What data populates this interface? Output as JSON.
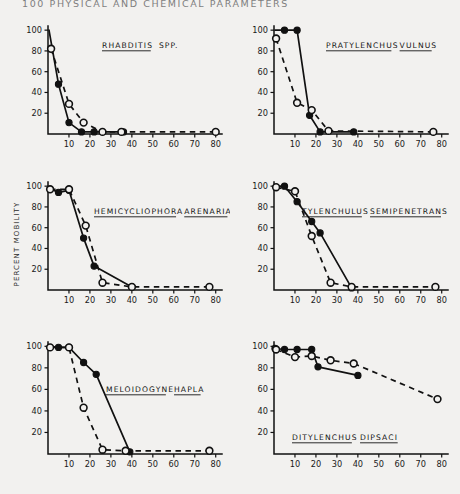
{
  "page": {
    "running_head": "100   PHYSICAL AND CHEMICAL PARAMETERS",
    "y_axis_label": "PERCENT MOBILITY",
    "ink_color": "#111111",
    "paper_color": "#f2f1ef"
  },
  "axes": {
    "y_ticks": [
      100,
      80,
      60,
      40,
      20
    ],
    "x_ticks": [
      10,
      20,
      30,
      40,
      50,
      60,
      70,
      80
    ],
    "xlim": [
      0,
      83
    ],
    "ylim": [
      0,
      104
    ]
  },
  "legend_keys": {
    "closed_circle": "solid line series (filled circles)",
    "open_circle": "dashed line series (open circles)"
  },
  "chart_data": [
    {
      "type": "line",
      "panel": 1,
      "title_words": [
        "RHABDITIS",
        "SPP."
      ],
      "title_underline": [
        true,
        false
      ],
      "xlabel": "",
      "ylabel": "PERCENT MOBILITY",
      "xlim": [
        0,
        83
      ],
      "ylim": [
        0,
        104
      ],
      "grid": false,
      "series": [
        {
          "name": "closed",
          "marker": "filled-circle",
          "line": "solid",
          "x": [
            0.5,
            5,
            10,
            16,
            22,
            36
          ],
          "y": [
            100,
            48,
            11,
            2,
            2,
            2
          ]
        },
        {
          "name": "open",
          "marker": "open-circle",
          "line": "dashed",
          "x": [
            1.5,
            10,
            17,
            26,
            35,
            80
          ],
          "y": [
            82,
            29,
            11,
            2,
            2,
            2
          ]
        }
      ]
    },
    {
      "type": "line",
      "panel": 2,
      "title_words": [
        "PRATYLENCHUS",
        "VULNUS"
      ],
      "title_underline": [
        true,
        true
      ],
      "xlabel": "",
      "ylabel": "",
      "xlim": [
        0,
        83
      ],
      "ylim": [
        0,
        104
      ],
      "grid": false,
      "series": [
        {
          "name": "closed",
          "marker": "filled-circle",
          "line": "solid",
          "x": [
            0.5,
            5,
            11,
            17,
            22,
            38
          ],
          "y": [
            100,
            100,
            100,
            18,
            2,
            2
          ]
        },
        {
          "name": "open",
          "marker": "open-circle",
          "line": "dashed",
          "x": [
            1,
            11,
            18,
            26,
            76
          ],
          "y": [
            92,
            30,
            23,
            3,
            2
          ]
        }
      ]
    },
    {
      "type": "line",
      "panel": 3,
      "title_words": [
        "HEMICYCLIOPHORA",
        "ARENARIA"
      ],
      "title_underline": [
        true,
        true
      ],
      "xlabel": "",
      "ylabel": "PERCENT MOBILITY",
      "xlim": [
        0,
        83
      ],
      "ylim": [
        0,
        104
      ],
      "grid": false,
      "series": [
        {
          "name": "closed",
          "marker": "filled-circle",
          "line": "solid",
          "x": [
            0.5,
            5,
            10,
            17,
            22,
            40
          ],
          "y": [
            98,
            94,
            96,
            50,
            23,
            3
          ]
        },
        {
          "name": "open",
          "marker": "open-circle",
          "line": "dashed",
          "x": [
            1,
            10,
            18,
            26,
            40,
            77
          ],
          "y": [
            97,
            97,
            62,
            7,
            3,
            3
          ]
        }
      ]
    },
    {
      "type": "line",
      "panel": 4,
      "title_words": [
        "TYLENCHULUS",
        "SEMIPENETRANS"
      ],
      "title_underline": [
        true,
        true
      ],
      "xlabel": "",
      "ylabel": "",
      "xlim": [
        0,
        83
      ],
      "ylim": [
        0,
        104
      ],
      "grid": false,
      "series": [
        {
          "name": "closed",
          "marker": "filled-circle",
          "line": "solid",
          "x": [
            0.5,
            5,
            11,
            18,
            22,
            37
          ],
          "y": [
            100,
            100,
            85,
            66,
            55,
            2
          ]
        },
        {
          "name": "open",
          "marker": "open-circle",
          "line": "dashed",
          "x": [
            1,
            10,
            18,
            27,
            37,
            77
          ],
          "y": [
            99,
            95,
            52,
            7,
            3,
            3
          ]
        }
      ]
    },
    {
      "type": "line",
      "panel": 5,
      "title_words": [
        "MELOIDOGYNE",
        "HAPLA"
      ],
      "title_underline": [
        true,
        true
      ],
      "xlabel": "",
      "ylabel": "",
      "xlim": [
        0,
        83
      ],
      "ylim": [
        0,
        104
      ],
      "grid": false,
      "series": [
        {
          "name": "closed",
          "marker": "filled-circle",
          "line": "solid",
          "x": [
            0.5,
            5,
            10,
            17,
            23,
            39
          ],
          "y": [
            100,
            99,
            99,
            85,
            74,
            2
          ]
        },
        {
          "name": "open",
          "marker": "open-circle",
          "line": "dashed",
          "x": [
            1,
            10,
            17,
            26,
            37,
            77
          ],
          "y": [
            99,
            99,
            43,
            4,
            3,
            3
          ]
        }
      ]
    },
    {
      "type": "line",
      "panel": 6,
      "title_words": [
        "DITYLENCHUS",
        "DIPSACI"
      ],
      "title_underline": [
        true,
        true
      ],
      "xlabel": "",
      "ylabel": "",
      "xlim": [
        0,
        83
      ],
      "ylim": [
        0,
        104
      ],
      "grid": false,
      "series": [
        {
          "name": "closed",
          "marker": "filled-circle",
          "line": "solid",
          "x": [
            0.5,
            5,
            11,
            18,
            21,
            40
          ],
          "y": [
            98,
            97,
            97,
            97,
            81,
            73
          ]
        },
        {
          "name": "open",
          "marker": "open-circle",
          "line": "dashed",
          "x": [
            1,
            10,
            18,
            27,
            38,
            78
          ],
          "y": [
            97,
            90,
            91,
            87,
            84,
            51
          ]
        }
      ]
    }
  ]
}
